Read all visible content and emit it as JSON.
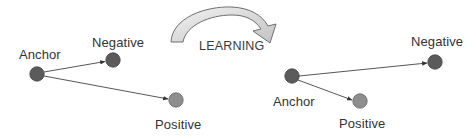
{
  "diagram": {
    "colors": {
      "anchor_fill": "#5b5b5b",
      "negative_fill": "#5b5b5b",
      "positive_fill": "#8e8e8e",
      "node_stroke": "#3f3f3f",
      "edge": "#444444",
      "arrow_fill_light": "#eeeeee",
      "arrow_fill_dark": "#c4c4c4",
      "arrow_stroke": "#6e6e6e",
      "text": "#333333"
    },
    "transition": {
      "label": "LEARNING",
      "icon": "curved-arrow-icon"
    },
    "before": {
      "anchor": {
        "label": "Anchor",
        "x": 37,
        "y": 74
      },
      "negative": {
        "label": "Negative",
        "x": 113,
        "y": 60
      },
      "positive": {
        "label": "Positive",
        "x": 176,
        "y": 100
      }
    },
    "after": {
      "anchor": {
        "label": "Anchor",
        "x": 292,
        "y": 76
      },
      "negative": {
        "label": "Negative",
        "x": 435,
        "y": 62
      },
      "positive": {
        "label": "Positive",
        "x": 360,
        "y": 101
      }
    }
  }
}
